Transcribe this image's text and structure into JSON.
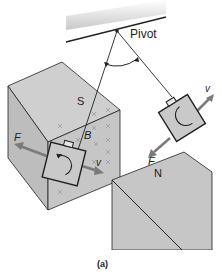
{
  "figure": {
    "caption": "(a)",
    "labels": {
      "pivot": "Pivot",
      "south_pole": "S",
      "north_pole": "N",
      "field": "B",
      "force_left": "F",
      "velocity_left": "v",
      "force_right": "F",
      "velocity_right": "v"
    },
    "colors": {
      "magnet_fill": "#c9c9c9",
      "magnet_dark": "#bdbdbd",
      "arrow": "#7a7a7a",
      "line": "#222222",
      "field_marks": "#9a9a9a"
    }
  }
}
